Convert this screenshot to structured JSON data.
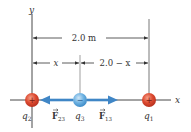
{
  "axes": {
    "x_label": "x",
    "y_label": "y"
  },
  "dimensions": {
    "total": "2.0 m",
    "left_segment": "x",
    "right_segment": "2.0 − x"
  },
  "charges": [
    {
      "id": "q2",
      "label": "q",
      "sub": "2",
      "sign": "+",
      "color": "#d9452e"
    },
    {
      "id": "q3",
      "label": "q",
      "sub": "3",
      "sign": "−",
      "color": "#5aa6dc"
    },
    {
      "id": "q1",
      "label": "q",
      "sub": "1",
      "sign": "+",
      "color": "#d9452e"
    }
  ],
  "forces": [
    {
      "id": "F23",
      "label": "F",
      "sub": "23",
      "direction": "left"
    },
    {
      "id": "F13",
      "label": "F",
      "sub": "13",
      "direction": "right"
    }
  ],
  "colors": {
    "arrow": "#3f86c6",
    "line": "#333333",
    "positive": "#d9452e",
    "negative": "#5aa6dc"
  }
}
